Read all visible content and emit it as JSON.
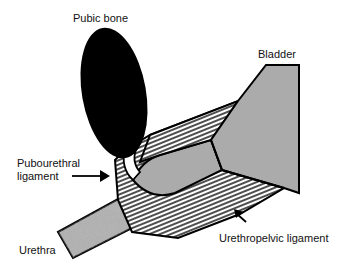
{
  "diagram": {
    "labels": {
      "pubic_bone": "Pubic bone",
      "bladder": "Bladder",
      "pubourethral_line1": "Pubourethral",
      "pubourethral_line2": "ligament",
      "urethra": "Urethra",
      "urethropelvic": "Urethropelvic ligament"
    },
    "colors": {
      "bone": "#000000",
      "stipple": "#a8a8a8",
      "hatch_line": "#222222",
      "outline": "#000000",
      "background": "#ffffff"
    }
  }
}
